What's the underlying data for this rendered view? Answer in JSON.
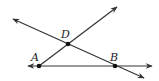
{
  "diagram": {
    "type": "geometry",
    "colors": {
      "line": "#333333",
      "point": "#111111",
      "background": "#ffffff"
    },
    "points": [
      {
        "id": "A",
        "label": "A",
        "x": 39,
        "y": 66,
        "label_x": 31,
        "label_y": 61
      },
      {
        "id": "D",
        "label": "D",
        "x": 68,
        "y": 44,
        "label_x": 61,
        "label_y": 38
      },
      {
        "id": "B",
        "label": "B",
        "x": 115,
        "y": 66,
        "label_x": 110,
        "label_y": 61
      }
    ],
    "lines": [
      {
        "id": "line-AB",
        "description": "horizontal line through A and B",
        "from": [
          28,
          66
        ],
        "to": [
          152,
          66
        ],
        "arrows": "both"
      },
      {
        "id": "ray-AD",
        "description": "ray from A through D",
        "from": [
          39,
          66
        ],
        "to": [
          117,
          7
        ],
        "arrows": "end"
      },
      {
        "id": "line-DB",
        "description": "line through D and B",
        "from": [
          13,
          19
        ],
        "to": [
          144,
          78
        ],
        "arrows": "both"
      }
    ]
  }
}
